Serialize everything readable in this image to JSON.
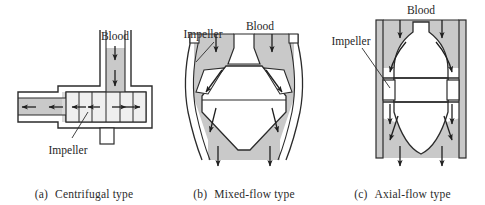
{
  "figure": {
    "colors": {
      "fluid_fill": "#c9c9c9",
      "outline": "#2b2b2b",
      "body_fill": "#ffffff",
      "text": "#262626",
      "background": "#ffffff"
    }
  },
  "panels": [
    {
      "id": "a",
      "caption_index": "(a)",
      "caption_text": "Centrifugal type",
      "labels": {
        "blood": "Blood",
        "impeller": "Impeller"
      },
      "flow": {
        "inlet_direction": "down",
        "outlet_direction": "radial-outward",
        "inlet_arrows": 2,
        "outlet_arrows_left": 2,
        "impeller_arrows": 4,
        "impeller_blade_lines": 5
      }
    },
    {
      "id": "b",
      "caption_index": "(b)",
      "caption_text": "Mixed-flow type",
      "labels": {
        "blood": "Blood",
        "impeller": "Impeller"
      },
      "flow": {
        "inlet_direction": "down",
        "outlet_direction": "diagonal-down-outward",
        "inlet_arrows": 2,
        "diagonal_arrows": 2,
        "outlet_arrows": 4
      }
    },
    {
      "id": "c",
      "caption_index": "(c)",
      "caption_text": "Axial-flow type",
      "labels": {
        "blood": "Blood",
        "impeller": "Impeller"
      },
      "flow": {
        "inlet_direction": "down",
        "outlet_direction": "down-axial",
        "inlet_arrows": 2,
        "curved_arrows": 2,
        "mid_arrows": 2,
        "lower_arrows": 2,
        "outlet_arrows": 2
      }
    }
  ]
}
